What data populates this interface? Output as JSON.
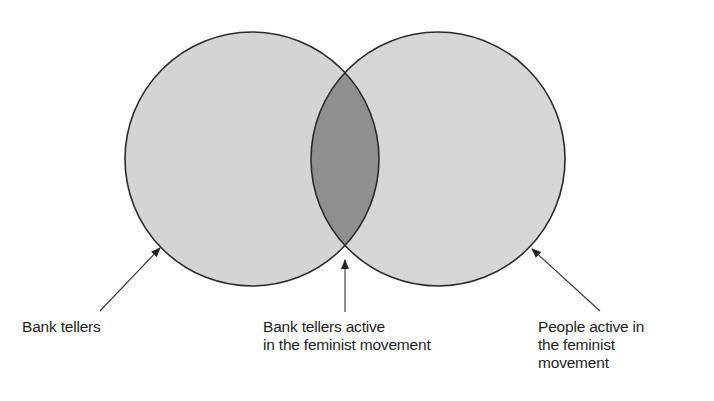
{
  "diagram": {
    "type": "venn",
    "colors": {
      "set_fill": "#d4d4d4",
      "intersection_fill": "#8f8f8f",
      "outline": "#2a2a2a",
      "arrow": "#333333"
    },
    "sets": [
      {
        "id": "bank-tellers",
        "label_lines": [
          "Bank tellers"
        ]
      },
      {
        "id": "feminists",
        "label_lines": [
          "People active in",
          "the feminist",
          "movement"
        ]
      }
    ],
    "intersection": {
      "label_lines": [
        "Bank tellers active",
        "in the feminist movement"
      ]
    }
  }
}
